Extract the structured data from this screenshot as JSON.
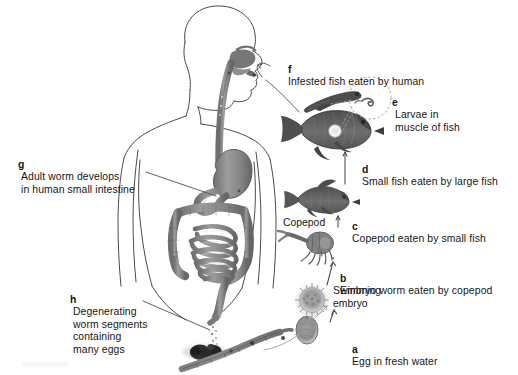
{
  "figure": {
    "background_color": "#ffffff",
    "ink_color": "#161616",
    "tissue_fill": "#8d8d8d"
  },
  "stages": [
    {
      "id": "a",
      "key": "a",
      "text": "Egg in fresh water",
      "x": 352,
      "y": 336
    },
    {
      "id": "b",
      "key": "b",
      "text": "Embryo worm eaten by copepod",
      "x": 340,
      "y": 265
    },
    {
      "id": "c",
      "key": "c",
      "text": "Copepod eaten by small fish",
      "x": 352,
      "y": 213
    },
    {
      "id": "d",
      "key": "d",
      "text": "Small fish eaten by large fish",
      "x": 362,
      "y": 156
    },
    {
      "id": "e",
      "key": "e",
      "text": "Larvae in\nmuscle of fish",
      "x": 392,
      "y": 89
    },
    {
      "id": "f",
      "key": "f",
      "text": "Infested fish eaten by human",
      "x": 288,
      "y": 57
    },
    {
      "id": "g",
      "key": "g",
      "text": "Adult worm develops\nin human small intestine",
      "x": 18,
      "y": 150
    },
    {
      "id": "h",
      "key": "h",
      "text": "Degenerating\nworm segments\ncontaining\nmany eggs",
      "x": 70,
      "y": 285
    }
  ],
  "annotations": [
    {
      "id": "copepod",
      "text": "Copepod",
      "x": 283,
      "y": 222
    },
    {
      "id": "swimming-embryo",
      "text": "Swimming\nembryo",
      "x": 333,
      "y": 290
    }
  ],
  "organisms": [
    {
      "name": "human-figure",
      "role": "definitive host"
    },
    {
      "name": "large-fish",
      "role": "second intermediate host"
    },
    {
      "name": "small-fish",
      "role": "first fish host"
    },
    {
      "name": "copepod",
      "role": "first intermediate host"
    },
    {
      "name": "swimming-embryo",
      "role": "coracidium"
    },
    {
      "name": "egg",
      "role": "egg in fresh water"
    },
    {
      "name": "larva",
      "role": "plerocercoid larva"
    },
    {
      "name": "adult-worm",
      "role": "adult tapeworm strobila"
    },
    {
      "name": "worm-segments",
      "role": "gravid proglottids in feces"
    }
  ],
  "human_anatomy": [
    "mouth",
    "tongue",
    "pharynx",
    "esophagus",
    "stomach",
    "duodenum",
    "small intestine",
    "transverse colon",
    "ascending colon",
    "descending colon",
    "rectum"
  ]
}
